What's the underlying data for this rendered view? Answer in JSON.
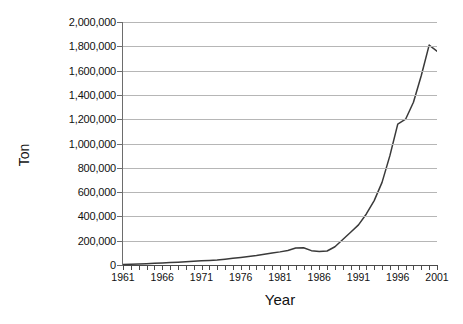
{
  "chart_data": {
    "type": "line",
    "title": "",
    "xlabel": "Year",
    "ylabel": "Ton",
    "xlim": [
      1961,
      2001
    ],
    "ylim": [
      0,
      2000000
    ],
    "grid": "horizontal",
    "legend": "none",
    "line_color": "#3a3a3a",
    "gridline_color": "#b6b6b6",
    "axis_color": "#4a4a4a",
    "background_color": "#ffffff",
    "y_tick_labels": [
      "2,000,000",
      "1,800,000",
      "1,600,000",
      "1,400,000",
      "1,200,000",
      "1,000,000",
      "800,000",
      "600,000",
      "400,000",
      "200,000",
      "0"
    ],
    "y_tick_values": [
      2000000,
      1800000,
      1600000,
      1400000,
      1200000,
      1000000,
      800000,
      600000,
      400000,
      200000,
      0
    ],
    "x_tick_labels": [
      "1961",
      "1966",
      "1971",
      "1976",
      "1981",
      "1986",
      "1991",
      "1996",
      "2001"
    ],
    "x_tick_values": [
      1961,
      1966,
      1971,
      1976,
      1981,
      1986,
      1991,
      1996,
      2001
    ],
    "x_minor_tick_interval": 1,
    "series": [
      {
        "name": "Ton",
        "x": [
          1961,
          1962,
          1963,
          1964,
          1965,
          1966,
          1967,
          1968,
          1969,
          1970,
          1971,
          1972,
          1973,
          1974,
          1975,
          1976,
          1977,
          1978,
          1979,
          1980,
          1981,
          1982,
          1983,
          1984,
          1985,
          1986,
          1987,
          1988,
          1989,
          1990,
          1991,
          1992,
          1993,
          1994,
          1995,
          1996,
          1997,
          1998,
          1999,
          2000,
          2001
        ],
        "values": [
          5000,
          7000,
          9000,
          11000,
          14000,
          17000,
          20000,
          23000,
          26000,
          30000,
          34000,
          38000,
          42000,
          48000,
          55000,
          62000,
          70000,
          78000,
          88000,
          98000,
          108000,
          120000,
          140000,
          142000,
          118000,
          112000,
          115000,
          150000,
          210000,
          270000,
          330000,
          420000,
          530000,
          680000,
          900000,
          1160000,
          1200000,
          1340000,
          1560000,
          1810000,
          1760000
        ]
      }
    ]
  }
}
